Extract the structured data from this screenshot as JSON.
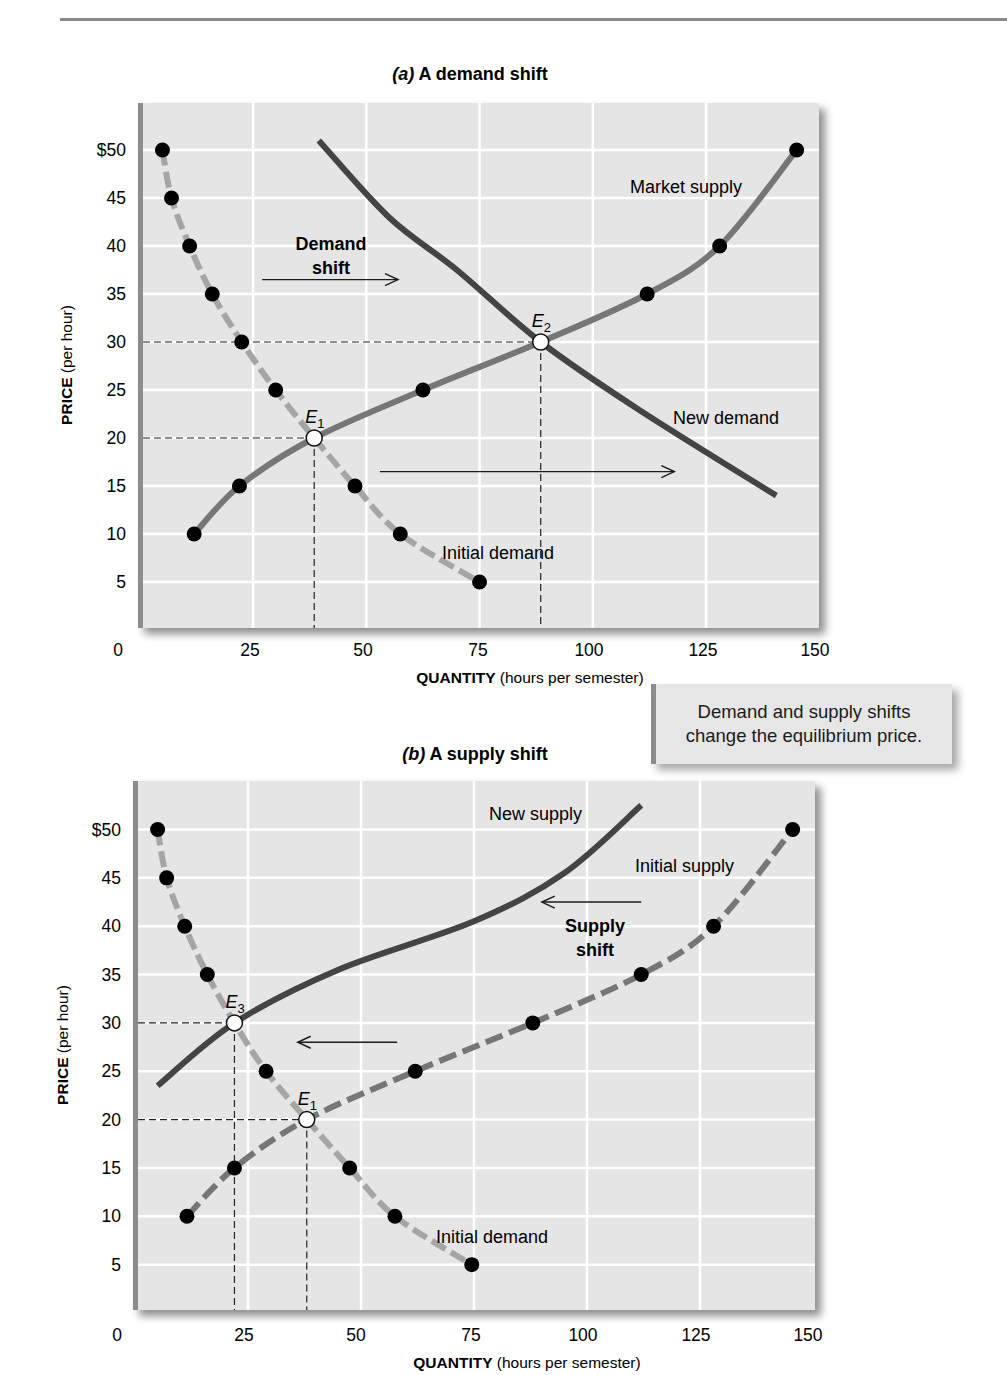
{
  "callout": {
    "line1": "Demand and supply shifts",
    "line2": "change the equilibrium price."
  },
  "colors": {
    "plot_bg": "#e5e5e5",
    "grid": "#ffffff",
    "axis_bar": "#8c8c8c",
    "light_curve": "#a5a5a5",
    "medium_curve": "#767676",
    "dark_curve": "#444444",
    "dot": "#000000",
    "equilibrium_fill": "#ffffff"
  },
  "chart_data": [
    {
      "type": "line",
      "title_prefix": "(a)",
      "title": "A demand shift",
      "xlabel_bold": "QUANTITY",
      "xlabel_rest": "(hours per semester)",
      "ylabel_bold": "PRICE",
      "ylabel_rest": "(per hour)",
      "xlim": [
        0,
        150
      ],
      "ylim": [
        0,
        50
      ],
      "x_ticks": [
        "0",
        "25",
        "50",
        "75",
        "100",
        "125",
        "150"
      ],
      "y_ticks": [
        "$50",
        "45",
        "40",
        "35",
        "30",
        "25",
        "20",
        "15",
        "10",
        "5"
      ],
      "grid": true,
      "series": [
        {
          "name": "Initial demand",
          "style": "dashed-light",
          "markers": true,
          "points": [
            [
              5,
              50
            ],
            [
              7,
              45
            ],
            [
              11,
              40
            ],
            [
              16,
              35
            ],
            [
              22.5,
              30
            ],
            [
              30,
              25
            ],
            [
              38.5,
              20
            ],
            [
              47.5,
              15
            ],
            [
              57.5,
              10
            ],
            [
              75,
              5
            ]
          ]
        },
        {
          "name": "Market supply",
          "style": "solid-medium",
          "markers": true,
          "points": [
            [
              12,
              10
            ],
            [
              22,
              15
            ],
            [
              38.5,
              20
            ],
            [
              62.5,
              25
            ],
            [
              88.5,
              30
            ],
            [
              112,
              35
            ],
            [
              128,
              40
            ],
            [
              145,
              50
            ]
          ]
        },
        {
          "name": "New demand",
          "style": "solid-dark",
          "markers": false,
          "points": [
            [
              39.5,
              51
            ],
            [
              55,
              43
            ],
            [
              70,
              37.5
            ],
            [
              88.5,
              30
            ],
            [
              110,
              23
            ],
            [
              140.5,
              14
            ]
          ]
        }
      ],
      "equilibria": [
        {
          "label": "E",
          "sub": "1",
          "q": 38.5,
          "p": 20
        },
        {
          "label": "E",
          "sub": "2",
          "q": 88.5,
          "p": 30
        }
      ],
      "annotations": [
        {
          "text_line1": "Demand",
          "text_line2": "shift",
          "bold": true
        },
        {
          "text": "Market supply"
        },
        {
          "text": "New demand"
        },
        {
          "text": "Initial demand"
        }
      ],
      "arrows": [
        {
          "from": [
            27,
            36.5
          ],
          "to": [
            57,
            36.5
          ],
          "direction": "right"
        },
        {
          "from": [
            53,
            16.5
          ],
          "to": [
            118,
            16.5
          ],
          "direction": "right"
        }
      ]
    },
    {
      "type": "line",
      "title_prefix": "(b)",
      "title": "A supply shift",
      "xlabel_bold": "QUANTITY",
      "xlabel_rest": "(hours per semester)",
      "ylabel_bold": "PRICE",
      "ylabel_rest": "(per hour)",
      "xlim": [
        0,
        150
      ],
      "ylim": [
        0,
        50
      ],
      "x_ticks": [
        "0",
        "25",
        "50",
        "75",
        "100",
        "125",
        "150"
      ],
      "y_ticks": [
        "$50",
        "45",
        "40",
        "35",
        "30",
        "25",
        "20",
        "15",
        "10",
        "5"
      ],
      "grid": true,
      "series": [
        {
          "name": "Initial demand",
          "style": "dashed-light",
          "markers": true,
          "points": [
            [
              5,
              50
            ],
            [
              7,
              45
            ],
            [
              11,
              40
            ],
            [
              16,
              35
            ],
            [
              22,
              30
            ],
            [
              29,
              25
            ],
            [
              38,
              20
            ],
            [
              47.5,
              15
            ],
            [
              57.5,
              10
            ],
            [
              74.5,
              5
            ]
          ]
        },
        {
          "name": "Initial supply",
          "style": "dashed-medium",
          "markers": true,
          "points": [
            [
              11.5,
              10
            ],
            [
              22,
              15
            ],
            [
              38,
              20
            ],
            [
              62,
              25
            ],
            [
              88,
              30
            ],
            [
              112,
              35
            ],
            [
              128,
              40
            ],
            [
              145.5,
              50
            ]
          ]
        },
        {
          "name": "New supply",
          "style": "solid-dark",
          "markers": false,
          "points": [
            [
              5,
              23.5
            ],
            [
              22,
              30
            ],
            [
              45,
              35.5
            ],
            [
              75,
              40.5
            ],
            [
              95,
              45.5
            ],
            [
              112,
              52.5
            ]
          ]
        }
      ],
      "equilibria": [
        {
          "label": "E",
          "sub": "3",
          "q": 22,
          "p": 30
        },
        {
          "label": "E",
          "sub": "1",
          "q": 38,
          "p": 20
        }
      ],
      "annotations": [
        {
          "text": "New supply"
        },
        {
          "text": "Initial supply"
        },
        {
          "text_line1": "Supply",
          "text_line2": "shift",
          "bold": true
        },
        {
          "text": "Initial demand"
        }
      ],
      "arrows": [
        {
          "from": [
            112,
            42.5
          ],
          "to": [
            90,
            42.5
          ],
          "direction": "left"
        },
        {
          "from": [
            58,
            28
          ],
          "to": [
            36,
            28
          ],
          "direction": "left"
        }
      ]
    }
  ]
}
